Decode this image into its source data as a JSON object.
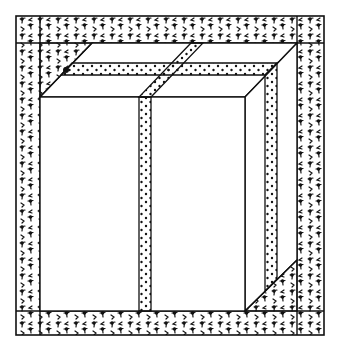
{
  "image": {
    "description": "Black-and-white line drawing of a gift box tied with a dotted ribbon, seen in a speckled (textured) square frame",
    "width": 337,
    "height": 351,
    "colors": {
      "background": "#ffffff",
      "ink": "#111111"
    },
    "frame": {
      "outer": {
        "x1": 16,
        "y1": 16,
        "x2": 324,
        "y2": 335
      },
      "inner": {
        "x1": 40,
        "y1": 43,
        "x2": 297,
        "y2": 311
      },
      "texture": "speckled-tack-marks"
    },
    "box": {
      "front": {
        "x1": 40,
        "y1": 97,
        "x2": 245,
        "y2": 311
      },
      "depth_offset": {
        "dx": 52,
        "dy": -54
      }
    },
    "ribbon": {
      "texture": "dots",
      "front_vertical": {
        "x1": 139,
        "x2": 151
      },
      "top_horizontal": {
        "y1": 63,
        "y2": 75
      },
      "side_vertical": {
        "x1": 265,
        "x2": 277
      }
    }
  }
}
